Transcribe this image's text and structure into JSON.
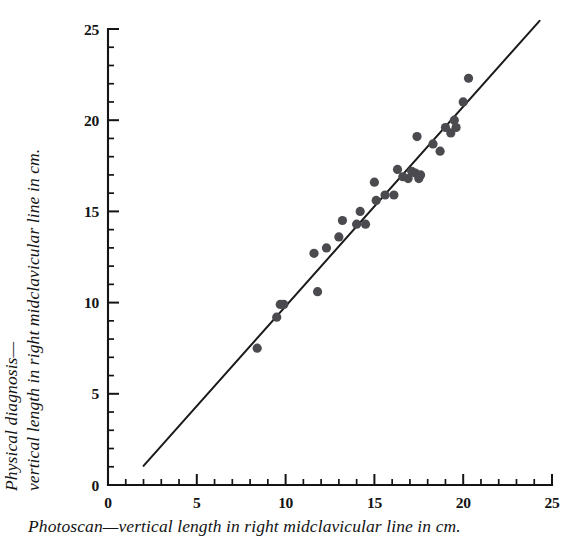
{
  "chart_data": {
    "type": "scatter",
    "title": "",
    "xlabel": "Photoscan—vertical length in right midclavicular line in cm.",
    "ylabel_line1": "Physical diagnosis—",
    "ylabel_line2": "vertical length in right midclavicular line in cm.",
    "xlim": [
      0,
      25
    ],
    "ylim": [
      0,
      25
    ],
    "xticks": [
      0,
      5,
      10,
      15,
      20,
      25
    ],
    "yticks": [
      0,
      5,
      10,
      15,
      20,
      25
    ],
    "xtick_labels": [
      "0",
      "5",
      "10",
      "15",
      "20",
      "25"
    ],
    "ytick_labels": [
      "0",
      "5",
      "10",
      "15",
      "20",
      "25"
    ],
    "minor_tick_interval": 1,
    "grid": false,
    "legend": "none",
    "marker_color": "#4a4a4f",
    "line_color": "#1b1b1b",
    "axis_color": "#141414",
    "fit_line": {
      "x_start": 2.0,
      "y_start": 1.05,
      "x_end": 24.3,
      "y_end": 25.45,
      "label": "identity-regression-line"
    },
    "points": [
      {
        "x": 8.4,
        "y": 7.5
      },
      {
        "x": 9.5,
        "y": 9.2
      },
      {
        "x": 9.7,
        "y": 9.9
      },
      {
        "x": 9.9,
        "y": 9.9
      },
      {
        "x": 11.8,
        "y": 10.6
      },
      {
        "x": 11.6,
        "y": 12.7
      },
      {
        "x": 12.3,
        "y": 13.0
      },
      {
        "x": 13.0,
        "y": 13.6
      },
      {
        "x": 13.2,
        "y": 14.5
      },
      {
        "x": 14.0,
        "y": 14.3
      },
      {
        "x": 14.2,
        "y": 15.0
      },
      {
        "x": 14.5,
        "y": 14.3
      },
      {
        "x": 15.0,
        "y": 16.6
      },
      {
        "x": 15.1,
        "y": 15.6
      },
      {
        "x": 15.6,
        "y": 15.9
      },
      {
        "x": 16.1,
        "y": 15.9
      },
      {
        "x": 16.3,
        "y": 17.3
      },
      {
        "x": 16.6,
        "y": 16.9
      },
      {
        "x": 16.9,
        "y": 16.8
      },
      {
        "x": 17.1,
        "y": 17.2
      },
      {
        "x": 17.3,
        "y": 17.1
      },
      {
        "x": 17.5,
        "y": 16.8
      },
      {
        "x": 17.6,
        "y": 17.0
      },
      {
        "x": 17.4,
        "y": 19.1
      },
      {
        "x": 18.3,
        "y": 18.7
      },
      {
        "x": 18.7,
        "y": 18.3
      },
      {
        "x": 19.0,
        "y": 19.6
      },
      {
        "x": 19.3,
        "y": 19.3
      },
      {
        "x": 19.5,
        "y": 20.0
      },
      {
        "x": 19.6,
        "y": 19.6
      },
      {
        "x": 20.0,
        "y": 21.0
      },
      {
        "x": 20.3,
        "y": 22.3
      }
    ]
  }
}
